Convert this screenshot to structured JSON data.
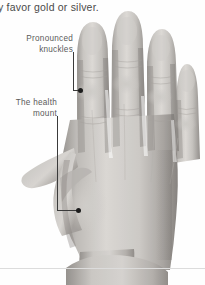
{
  "page": {
    "width": 205,
    "height": 285,
    "background_color": "#ffffff",
    "figure_type": "annotated-photograph"
  },
  "running_text": {
    "text": "y favor gold or silver.",
    "note": "line clipped at left page edge",
    "color": "#4a4a4a"
  },
  "annotations": [
    {
      "id": "pronounced-knuckles",
      "line1": "Pronounced",
      "line2": "knuckles",
      "text_x": 18,
      "text_y": 33,
      "leader": {
        "vx": 73,
        "vy_top": 52,
        "vy_bottom": 90,
        "hx_end": 78
      },
      "dot": {
        "x": 80,
        "y": 90
      },
      "color": "#5a5a5a"
    },
    {
      "id": "health-mount",
      "line1": "The health",
      "line2": "mount",
      "text_x": 10,
      "text_y": 97,
      "leader": {
        "vx": 57,
        "vy_top": 116,
        "vy_bottom": 210,
        "hx_end": 76
      },
      "dot": {
        "x": 78,
        "y": 210
      },
      "color": "#5a5a5a"
    }
  ],
  "photo": {
    "description": "grayscale photograph of the dorsal (back) view of a left hand, fingers extended upward, thumb to the left, wrist at bottom",
    "skin_light": "#d8d5d2",
    "skin_mid": "#b9b5b1",
    "skin_shadow": "#8e8a86",
    "skin_deep_shadow": "#6e6a67",
    "fingers": [
      {
        "name": "index",
        "tip_y": 22,
        "left": 75,
        "right": 110
      },
      {
        "name": "middle",
        "tip_y": 12,
        "left": 110,
        "right": 145
      },
      {
        "name": "ring",
        "tip_y": 30,
        "left": 145,
        "right": 175
      },
      {
        "name": "pinky",
        "tip_y": 65,
        "left": 175,
        "right": 200
      }
    ],
    "thumb": {
      "extends_left_to": 22,
      "knuckle_y": 175
    },
    "wrist": {
      "top_y": 255,
      "narrow_x_left": 78,
      "narrow_x_right": 165
    }
  },
  "rule": {
    "y": 268,
    "color": "#dcdcdc"
  },
  "colors": {
    "leader_line": "#3a3a3a",
    "dot": "#1c1c1c",
    "text": "#5a5a5a",
    "running_text": "#4a4a4a"
  }
}
